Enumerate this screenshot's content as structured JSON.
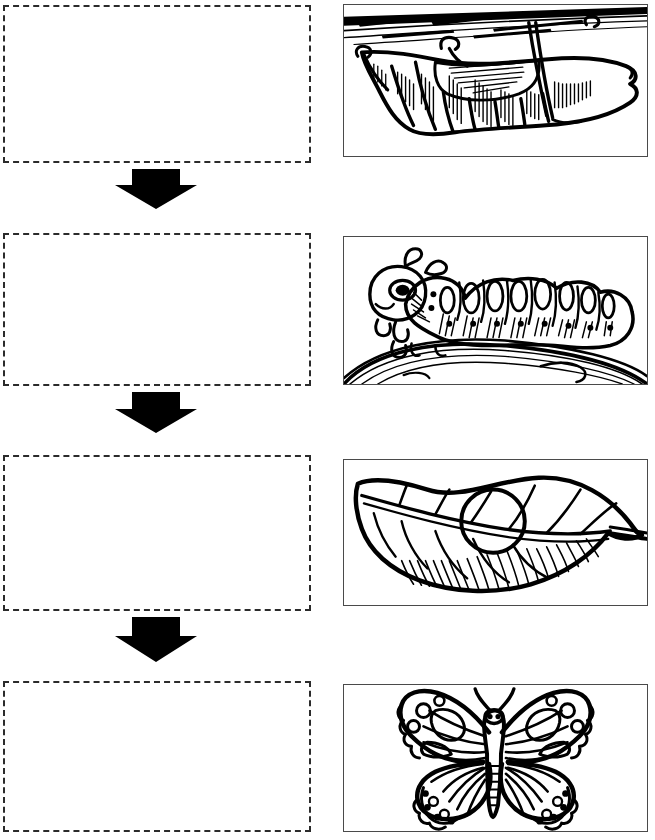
{
  "worksheet": {
    "title": "Butterfly Life Cycle Sequence Worksheet",
    "subject": "butterfly life cycle",
    "page_width": 655,
    "page_height": 840,
    "background_color": "#ffffff",
    "ink_color": "#000000",
    "dashed_border_color": "#2b2b2b",
    "figure_border_color": "#4a4a4a"
  },
  "instructions": {
    "text": ""
  },
  "rows": [
    {
      "index": 1,
      "answer_box": {
        "label": "",
        "placeholder": "",
        "value": "",
        "x": 3,
        "y": 5,
        "width": 308,
        "height": 158
      },
      "figure": {
        "name": "chrysalis-illustration",
        "caption": "",
        "alt": "Chrysalis (pupa) hanging from a twig",
        "stage": "pupa",
        "x": 343,
        "y": 4,
        "width": 305,
        "height": 153
      }
    },
    {
      "index": 2,
      "answer_box": {
        "label": "",
        "placeholder": "",
        "value": "",
        "x": 3,
        "y": 233,
        "width": 308,
        "height": 153
      },
      "figure": {
        "name": "caterpillar-illustration",
        "caption": "",
        "alt": "Caterpillar (larva) crawling on a branch",
        "stage": "larva",
        "x": 343,
        "y": 236,
        "width": 305,
        "height": 149
      }
    },
    {
      "index": 3,
      "answer_box": {
        "label": "",
        "placeholder": "",
        "value": "",
        "x": 3,
        "y": 455,
        "width": 308,
        "height": 156
      },
      "figure": {
        "name": "egg-on-leaf-illustration",
        "caption": "",
        "alt": "Single egg resting on a leaf",
        "stage": "egg",
        "x": 343,
        "y": 459,
        "width": 305,
        "height": 147
      }
    },
    {
      "index": 4,
      "answer_box": {
        "label": "",
        "placeholder": "",
        "value": "",
        "x": 3,
        "y": 681,
        "width": 308,
        "height": 151
      },
      "figure": {
        "name": "butterfly-illustration",
        "caption": "",
        "alt": "Adult butterfly with open wings",
        "stage": "adult",
        "x": 343,
        "y": 684,
        "width": 305,
        "height": 148
      }
    }
  ],
  "arrows": [
    {
      "index": 1,
      "direction": "down",
      "x": 115,
      "y": 169,
      "width": 82,
      "height": 40
    },
    {
      "index": 2,
      "direction": "down",
      "x": 115,
      "y": 392,
      "width": 82,
      "height": 41
    },
    {
      "index": 3,
      "direction": "down",
      "x": 115,
      "y": 617,
      "width": 82,
      "height": 45
    }
  ]
}
